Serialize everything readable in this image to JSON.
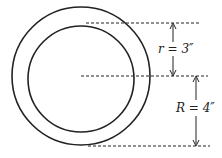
{
  "diagram": {
    "title": "",
    "shapes": {
      "outer_circle": {
        "cx": 81,
        "cy": 76,
        "r": 69,
        "stroke": "#222222"
      },
      "inner_circle": {
        "cx": 81,
        "cy": 76,
        "r": 53,
        "stroke": "#222222"
      }
    },
    "dimensions": [
      {
        "label": "r = 3″",
        "symbol": "r",
        "value": "3″"
      },
      {
        "label": "R = 4″",
        "symbol": "R",
        "value": "4″"
      }
    ]
  }
}
